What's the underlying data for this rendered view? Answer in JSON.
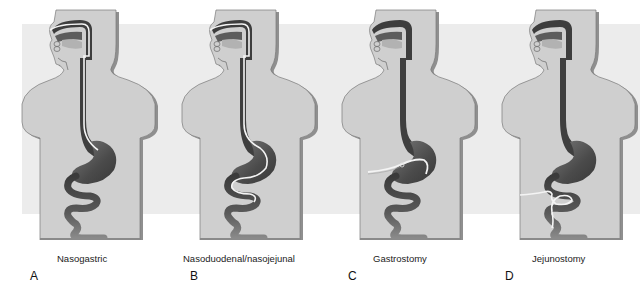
{
  "figure": {
    "colors": {
      "body_fill": "#cfcfcf",
      "body_shadow": "#8f8f8f",
      "body_outline": "#6a6a6a",
      "gi_dark": "#3d3d3d",
      "gi_mid": "#6d6d6d",
      "gi_light": "#9a9a9a",
      "tube": "#f4f4f4",
      "background_band": "#ececec"
    },
    "panels": [
      {
        "letter": "A",
        "caption": "Nasogastric",
        "tube_route": "nose-to-stomach"
      },
      {
        "letter": "B",
        "caption": "Nasoduodenal/nasojejunal",
        "tube_route": "nose-to-small-intestine"
      },
      {
        "letter": "C",
        "caption": "Gastrostomy",
        "tube_route": "abdominal-wall-to-stomach"
      },
      {
        "letter": "D",
        "caption": "Jejunostomy",
        "tube_route": "abdominal-wall-to-jejunum"
      }
    ]
  }
}
